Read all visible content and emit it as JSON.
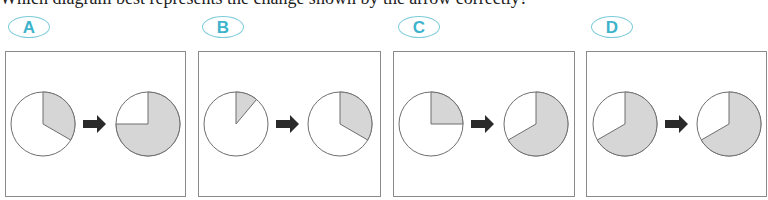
{
  "cut_off_text": "Which diagram best represents the change shown by the arrow correctly?",
  "options": [
    {
      "label": "A",
      "before_shaded_deg": 120,
      "after_shaded_deg": 270
    },
    {
      "label": "B",
      "before_shaded_deg": 40,
      "after_shaded_deg": 120
    },
    {
      "label": "C",
      "before_shaded_deg": 90,
      "after_shaded_deg": 240
    },
    {
      "label": "D",
      "before_shaded_deg": 240,
      "after_shaded_deg": 240
    }
  ],
  "colors": {
    "label_text": "#3db3cc",
    "label_border": "#7ccbd9",
    "shade": "#d6d6d6",
    "outline": "#6e6e6e",
    "arrow": "#2a2a2a"
  }
}
